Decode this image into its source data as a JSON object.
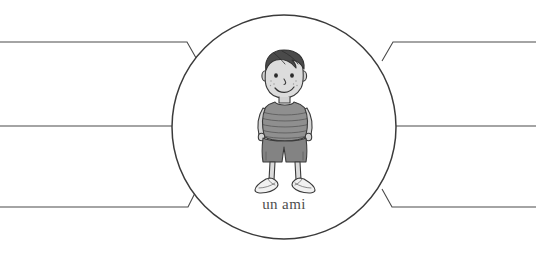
{
  "worksheet": {
    "title": "un ami",
    "type": "word-web-graphic-organizer",
    "center": {
      "label": "un ami",
      "illustration": {
        "name": "boy-illustration",
        "description": "cartoon boy with dark hair, freckles, striped t-shirt, shorts and sneakers",
        "colors": {
          "hair": "#3f3f3f",
          "skin": "#d9d9d9",
          "shirt": "#8c8c8c",
          "shorts": "#7e7e7e",
          "shoes": "#efefef",
          "outline": "#3a3a3a"
        }
      }
    },
    "branches": [
      {
        "id": "branch-top-left",
        "side": "left",
        "position": "top",
        "label": ""
      },
      {
        "id": "branch-middle-left",
        "side": "left",
        "position": "middle",
        "label": ""
      },
      {
        "id": "branch-bottom-left",
        "side": "left",
        "position": "bottom",
        "label": ""
      },
      {
        "id": "branch-top-right",
        "side": "right",
        "position": "top",
        "label": ""
      },
      {
        "id": "branch-middle-right",
        "side": "right",
        "position": "middle",
        "label": ""
      },
      {
        "id": "branch-bottom-right",
        "side": "right",
        "position": "bottom",
        "label": ""
      }
    ],
    "geometry": {
      "circle_center_x": 284,
      "circle_center_y": 127,
      "circle_radius": 112,
      "line_top_y": 42,
      "line_middle_y": 126,
      "line_bottom_y": 207
    },
    "colors": {
      "line": "#4a4a4a",
      "bubble_outline": "#3b3b3b",
      "background": "#ffffff",
      "label_text": "#4e4e4e"
    }
  }
}
